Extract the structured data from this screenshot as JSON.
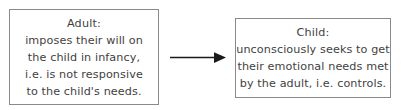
{
  "diagram": {
    "type": "flow",
    "background_color": "#ffffff",
    "text_color": "#3f3f3f",
    "border_color": "#8a8a8a",
    "arrow_color": "#1a1a1a",
    "nodes": [
      {
        "id": "adult",
        "title": "Adult:",
        "lines": [
          "Adult:",
          "imposes their will on",
          "the child in infancy,",
          "i.e. is not responsive",
          "to the child's needs."
        ]
      },
      {
        "id": "child",
        "title": "Child:",
        "lines": [
          "Child:",
          "unconsciously seeks to get",
          "their emotional needs met",
          "by the adult, i.e. controls."
        ]
      }
    ],
    "connector": {
      "from": "adult",
      "to": "child",
      "style": "solid-arrow",
      "label": ""
    }
  }
}
